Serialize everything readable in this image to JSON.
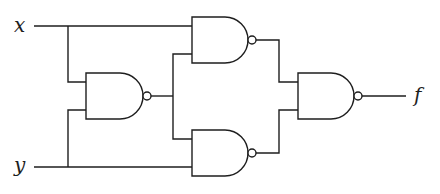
{
  "diagram": {
    "type": "logic-circuit",
    "inputs": [
      {
        "id": "x",
        "label": "x"
      },
      {
        "id": "y",
        "label": "y"
      }
    ],
    "outputs": [
      {
        "id": "f",
        "label": "f"
      }
    ],
    "gates": [
      {
        "id": "g1",
        "type": "NAND",
        "inputs": [
          "x",
          "y"
        ]
      },
      {
        "id": "g2",
        "type": "NAND",
        "inputs": [
          "x",
          "g1"
        ]
      },
      {
        "id": "g3",
        "type": "NAND",
        "inputs": [
          "g1",
          "y"
        ]
      },
      {
        "id": "g4",
        "type": "NAND",
        "inputs": [
          "g2",
          "g3"
        ],
        "output": "f"
      }
    ],
    "colors": {
      "stroke": "#1e1e1e",
      "background": "#ffffff"
    }
  }
}
